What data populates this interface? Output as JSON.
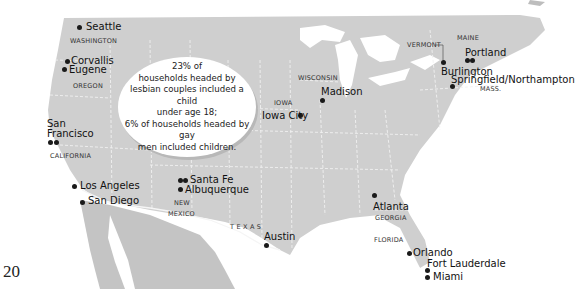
{
  "page_number": "20",
  "colors": {
    "land": "#cfcfcf",
    "mexico": "#c4c4c4",
    "water": "#ffffff",
    "borders": "#f0f0f0",
    "dots": "#1a1a1a"
  },
  "callout": {
    "line1": "23% of",
    "line2": "households headed by",
    "line3": "lesbian couples included a child",
    "line4": "under age 18;",
    "line5": "6% of households headed by gay",
    "line6": "men included children."
  },
  "states": {
    "washington": "WASHINGTON",
    "oregon": "OREGON",
    "california": "CALIFORNIA",
    "new_mexico_1": "NEW",
    "new_mexico_2": "MEXICO",
    "texas": "T E X A S",
    "iowa": "IOWA",
    "wisconsin": "WISCONSIN",
    "vermont": "VERMONT",
    "maine": "MAINE",
    "mass": "MASS.",
    "georgia": "GEORGIA",
    "florida": "FLORIDA"
  },
  "cities": {
    "seattle": "Seattle",
    "corvallis": "Corvallis",
    "eugene": "Eugene",
    "san_francisco_1": "San",
    "san_francisco_2": "Francisco",
    "los_angeles": "Los Angeles",
    "san_diego": "San Diego",
    "santa_fe": "Santa Fe",
    "albuquerque": "Albuquerque",
    "austin": "Austin",
    "iowa_city": "Iowa City",
    "madison": "Madison",
    "burlington": "Burlington",
    "portland": "Portland",
    "springfield": "Springfield/Northampton",
    "atlanta": "Atlanta",
    "orlando": "Orlando",
    "fort_lauderdale": "Fort Lauderdale",
    "miami": "Miami"
  }
}
